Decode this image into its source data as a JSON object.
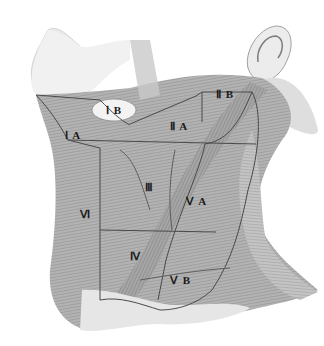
{
  "diagram": {
    "colors": {
      "background": "#ffffff",
      "tissue_light": "#d9d9d9",
      "tissue_mid": "#a8a8a8",
      "tissue_dark": "#6e6e6e",
      "boundary_line": "#4a4a4a",
      "label_text": "#1a1a1a"
    },
    "labels": [
      {
        "id": "IA",
        "text": "Ⅰ A",
        "x": 72,
        "y": 135
      },
      {
        "id": "IB",
        "text": "Ⅰ B",
        "x": 107,
        "y": 111
      },
      {
        "id": "IIA",
        "text": "Ⅱ A",
        "x": 173,
        "y": 126
      },
      {
        "id": "IIB",
        "text": "Ⅱ B",
        "x": 216,
        "y": 94
      },
      {
        "id": "III",
        "text": "Ⅲ",
        "x": 146,
        "y": 187
      },
      {
        "id": "VA",
        "text": "Ⅴ A",
        "x": 187,
        "y": 200
      },
      {
        "id": "VI",
        "text": "Ⅵ",
        "x": 80,
        "y": 213
      },
      {
        "id": "IV",
        "text": "Ⅳ",
        "x": 130,
        "y": 255
      },
      {
        "id": "VB",
        "text": "Ⅴ B",
        "x": 171,
        "y": 280
      }
    ]
  }
}
